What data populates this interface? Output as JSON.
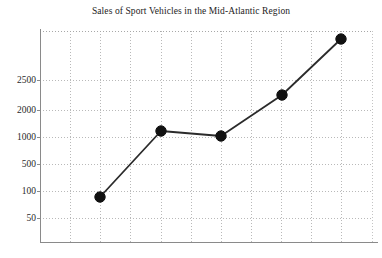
{
  "chart_data": {
    "type": "line",
    "title": "Sales of Sport Vehicles in the Mid-Atlantic Region",
    "xlabel": "",
    "ylabel": "",
    "grid": true,
    "legend": false,
    "marker": "filled-circle",
    "line_color": "#2b2b2b",
    "marker_color": "#111111",
    "grid_color": "#b9b9b9",
    "axis_color": "#8a8a8a",
    "background": "#ffffff",
    "y_tick_labels": [
      "2500",
      "2000",
      "1000",
      "500",
      "100",
      "50"
    ],
    "y_tick_values": [
      2500,
      2000,
      1000,
      500,
      100,
      50
    ],
    "x_tick_labels": [],
    "x": [
      1,
      2,
      3,
      4,
      5
    ],
    "values": [
      100,
      1150,
      1050,
      2300,
      3400
    ],
    "series": [
      {
        "name": "Sales",
        "values": [
          100,
          1150,
          1050,
          2300,
          3400
        ]
      }
    ],
    "points": [
      {
        "x": 1,
        "y": 100,
        "label": "100"
      },
      {
        "x": 2,
        "y": 1150,
        "label": "1150"
      },
      {
        "x": 3,
        "y": 1050,
        "label": "1050"
      },
      {
        "x": 4,
        "y": 2300,
        "label": "2300"
      },
      {
        "x": 5,
        "y": 3400,
        "label": "3400"
      }
    ]
  },
  "geometry": {
    "plot_left": 40,
    "plot_right": 372,
    "plot_top": 31,
    "plot_bottom": 242,
    "vertical_gridlines": [
      70,
      100,
      130,
      161,
      191,
      221,
      251,
      281,
      311,
      341
    ],
    "horizontal_gridlines": [
      80,
      110,
      137,
      164,
      191,
      218
    ],
    "ytick_pixels": [
      80,
      110,
      137,
      164,
      191,
      218
    ],
    "point_pixels": [
      {
        "cx": 100,
        "cy": 197
      },
      {
        "cx": 161,
        "cy": 131
      },
      {
        "cx": 221,
        "cy": 136
      },
      {
        "cx": 282,
        "cy": 95
      },
      {
        "cx": 341,
        "cy": 39
      }
    ],
    "marker_radius": 5.2
  }
}
